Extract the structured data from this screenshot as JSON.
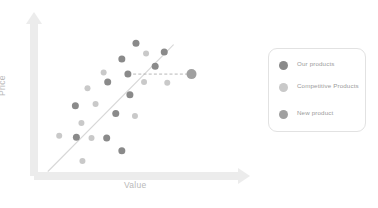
{
  "chart_data": {
    "type": "scatter",
    "title": "",
    "xlabel": "Value",
    "ylabel": "Price",
    "xlim": [
      0,
      100
    ],
    "ylim": [
      0,
      100
    ],
    "grid": false,
    "legend_position": "right",
    "colors": {
      "our_products": "#8a8a8a",
      "competitive_products": "#c9c9c9",
      "new_product": "#a0a0a0",
      "axis": "#ececec",
      "trendline": "#d8d8d8",
      "dashed_connector": "#b0b0b0",
      "legend_border": "#e2e2e2",
      "legend_text": "#9a9a9a",
      "axis_label_text": "#b9b9b9"
    },
    "series": [
      {
        "name": "Our products",
        "color": "#8a8a8a",
        "marker_size": 7,
        "points": [
          {
            "x": 48.5,
            "y": 84.0
          },
          {
            "x": 41.5,
            "y": 74.0
          },
          {
            "x": 44.5,
            "y": 64.5
          },
          {
            "x": 62.5,
            "y": 78.5
          },
          {
            "x": 58.0,
            "y": 69.5
          },
          {
            "x": 34.5,
            "y": 59.5
          },
          {
            "x": 45.5,
            "y": 51.5
          },
          {
            "x": 18.5,
            "y": 44.5
          },
          {
            "x": 38.5,
            "y": 39.5
          },
          {
            "x": 19.0,
            "y": 24.5
          },
          {
            "x": 34.0,
            "y": 24.0
          },
          {
            "x": 41.5,
            "y": 16.0
          }
        ]
      },
      {
        "name": "Competitive Products",
        "color": "#c9c9c9",
        "marker_size": 6,
        "points": [
          {
            "x": 53.5,
            "y": 77.5
          },
          {
            "x": 32.5,
            "y": 65.5
          },
          {
            "x": 52.5,
            "y": 59.5
          },
          {
            "x": 64.0,
            "y": 59.0
          },
          {
            "x": 24.5,
            "y": 55.5
          },
          {
            "x": 28.5,
            "y": 45.5
          },
          {
            "x": 48.0,
            "y": 38.0
          },
          {
            "x": 21.5,
            "y": 33.5
          },
          {
            "x": 10.5,
            "y": 25.5
          },
          {
            "x": 26.5,
            "y": 24.0
          },
          {
            "x": 22.0,
            "y": 9.5
          }
        ]
      },
      {
        "name": "New product",
        "color": "#a0a0a0",
        "marker_size": 10,
        "points": [
          {
            "x": 76.0,
            "y": 64.5
          }
        ]
      }
    ],
    "trendline": {
      "x0": 5.0,
      "y0": 3.0,
      "x1": 67.0,
      "y1": 83.0
    },
    "connector": {
      "from": {
        "x": 44.5,
        "y": 64.5
      },
      "to": {
        "x": 76.0,
        "y": 64.5
      },
      "style": "dashed"
    }
  },
  "legend": {
    "items": [
      {
        "label": "Our products"
      },
      {
        "label": "Competitive Products"
      },
      {
        "label": "New product"
      }
    ]
  },
  "axes": {
    "x_title": "Value",
    "y_title": "Price"
  }
}
